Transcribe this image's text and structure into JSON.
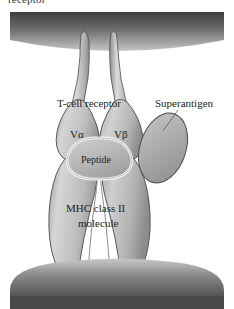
{
  "figure": {
    "title_fragment": "receptor",
    "background_color": "#ffffff",
    "width": 234,
    "height": 309
  },
  "labels": {
    "tcr": "T-cell receptor",
    "superantigen": "Superantigen",
    "v_alpha": "Vα",
    "v_beta": "Vβ",
    "peptide": "Peptide",
    "mhc_line1": "MHC class II",
    "mhc_line2": "molecule"
  },
  "colors": {
    "membrane_dark": "#4a4a4a",
    "membrane_light": "#b9b9b9",
    "protein_fill": "#b3b3b3",
    "protein_light": "#d8d8d8",
    "protein_shadow": "#8d8d8d",
    "outline": "#3c3c3c",
    "peptide_outline": "#ffffff",
    "text": "#231f20"
  },
  "elements": {
    "top_membrane": "top-cell-membrane",
    "bottom_membrane": "bottom-cell-membrane",
    "tcr_body": "t-cell-receptor-body",
    "mhc_body": "mhc-class-ii-body",
    "peptide_shape": "peptide-groove",
    "superantigen_shape": "superantigen-oval",
    "leader_line": "superantigen-leader-line"
  }
}
